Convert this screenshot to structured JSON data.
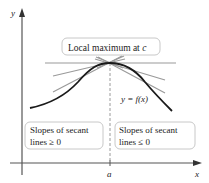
{
  "figure": {
    "title_label": {
      "text": "Local maximum at ",
      "var": "c"
    },
    "curve_label": "y = f(x)",
    "left_box": {
      "line1": "Slopes of secant",
      "line2": "lines ≥ 0"
    },
    "right_box": {
      "line1": "Slopes of secant",
      "line2": "lines ≤ 0"
    },
    "axes": {
      "x_label": "x",
      "y_label": "y",
      "x_tick_label": "a"
    },
    "colors": {
      "curve": "#1a1a1a",
      "secant_lines": "#9a9a9a",
      "axes": "#555555",
      "dashed_line": "#9a9a9a",
      "box_border": "#c8c8c8"
    }
  }
}
